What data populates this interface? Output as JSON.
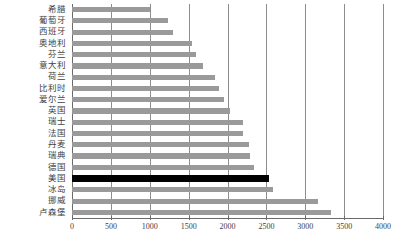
{
  "chart_data": {
    "type": "bar",
    "orientation": "horizontal",
    "title": "",
    "subtitle": "",
    "xlabel": "",
    "ylabel": "",
    "xlim": [
      0,
      4000
    ],
    "xticks": [
      0,
      500,
      1000,
      1500,
      2000,
      2500,
      3000,
      3500,
      4000
    ],
    "xtick_labels": [
      "0",
      "500",
      "1000",
      "1500",
      "2000",
      "2500",
      "3000",
      "3500",
      "4000"
    ],
    "grid": true,
    "gridlines_axis": "x",
    "legend": null,
    "legend_position": "none",
    "bar_color": "#9a9a9a",
    "highlight_color": "#000000",
    "highlighted_category": "美国",
    "categories": [
      "希腊",
      "葡萄牙",
      "西班牙",
      "奥地利",
      "芬兰",
      "意大利",
      "荷兰",
      "比利时",
      "爱尔兰",
      "英国",
      "瑞士",
      "法国",
      "丹麦",
      "瑞典",
      "德国",
      "美国",
      "冰岛",
      "挪威",
      "卢森堡"
    ],
    "values": [
      1000,
      1230,
      1300,
      1540,
      1590,
      1690,
      1840,
      1890,
      1950,
      2030,
      2200,
      2200,
      2280,
      2290,
      2340,
      2540,
      2590,
      3170,
      3330
    ]
  }
}
